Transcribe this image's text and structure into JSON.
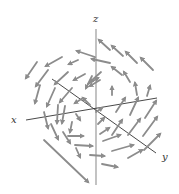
{
  "figure": {
    "type": "3d-vector-field",
    "axes": {
      "x_label": "x",
      "y_label": "y",
      "z_label": "z"
    },
    "colors": {
      "arrow": "#8c8c8c",
      "axis": "#333333",
      "z_axis": "#9a9a9a",
      "background": "#ffffff"
    },
    "arrows": [
      {
        "x1": 153,
        "y1": 70,
        "x2": 141,
        "y2": 58
      },
      {
        "x1": 137,
        "y1": 63,
        "x2": 126,
        "y2": 52
      },
      {
        "x1": 123,
        "y1": 56,
        "x2": 112,
        "y2": 46
      },
      {
        "x1": 110,
        "y1": 50,
        "x2": 99,
        "y2": 40
      },
      {
        "x1": 95,
        "y1": 57,
        "x2": 77,
        "y2": 51
      },
      {
        "x1": 37,
        "y1": 62,
        "x2": 26,
        "y2": 78
      },
      {
        "x1": 62,
        "y1": 57,
        "x2": 46,
        "y2": 66
      },
      {
        "x1": 78,
        "y1": 60,
        "x2": 69,
        "y2": 64
      },
      {
        "x1": 110,
        "y1": 63,
        "x2": 92,
        "y2": 59
      },
      {
        "x1": 122,
        "y1": 75,
        "x2": 112,
        "y2": 67
      },
      {
        "x1": 130,
        "y1": 82,
        "x2": 124,
        "y2": 72
      },
      {
        "x1": 48,
        "y1": 70,
        "x2": 36,
        "y2": 86
      },
      {
        "x1": 68,
        "y1": 72,
        "x2": 55,
        "y2": 84
      },
      {
        "x1": 85,
        "y1": 74,
        "x2": 74,
        "y2": 80
      },
      {
        "x1": 100,
        "y1": 80,
        "x2": 90,
        "y2": 86
      },
      {
        "x1": 92,
        "y1": 76,
        "x2": 86,
        "y2": 88
      },
      {
        "x1": 101,
        "y1": 72,
        "x2": 90,
        "y2": 82
      },
      {
        "x1": 112,
        "y1": 95,
        "x2": 112,
        "y2": 87
      },
      {
        "x1": 137,
        "y1": 95,
        "x2": 135,
        "y2": 83
      },
      {
        "x1": 147,
        "y1": 96,
        "x2": 150,
        "y2": 86
      },
      {
        "x1": 40,
        "y1": 85,
        "x2": 35,
        "y2": 103
      },
      {
        "x1": 55,
        "y1": 88,
        "x2": 47,
        "y2": 106
      },
      {
        "x1": 72,
        "y1": 88,
        "x2": 60,
        "y2": 102
      },
      {
        "x1": 83,
        "y1": 98,
        "x2": 75,
        "y2": 103
      },
      {
        "x1": 90,
        "y1": 105,
        "x2": 83,
        "y2": 98
      },
      {
        "x1": 116,
        "y1": 112,
        "x2": 125,
        "y2": 98
      },
      {
        "x1": 130,
        "y1": 115,
        "x2": 138,
        "y2": 98
      },
      {
        "x1": 145,
        "y1": 118,
        "x2": 156,
        "y2": 101
      },
      {
        "x1": 44,
        "y1": 112,
        "x2": 48,
        "y2": 128
      },
      {
        "x1": 58,
        "y1": 105,
        "x2": 57,
        "y2": 123
      },
      {
        "x1": 65,
        "y1": 106,
        "x2": 62,
        "y2": 123
      },
      {
        "x1": 76,
        "y1": 114,
        "x2": 80,
        "y2": 120
      },
      {
        "x1": 72,
        "y1": 122,
        "x2": 70,
        "y2": 132
      },
      {
        "x1": 98,
        "y1": 124,
        "x2": 104,
        "y2": 118
      },
      {
        "x1": 112,
        "y1": 135,
        "x2": 122,
        "y2": 120
      },
      {
        "x1": 128,
        "y1": 135,
        "x2": 140,
        "y2": 119
      },
      {
        "x1": 143,
        "y1": 136,
        "x2": 157,
        "y2": 117
      },
      {
        "x1": 144,
        "y1": 150,
        "x2": 160,
        "y2": 134
      },
      {
        "x1": 51,
        "y1": 124,
        "x2": 58,
        "y2": 139
      },
      {
        "x1": 63,
        "y1": 132,
        "x2": 70,
        "y2": 143
      },
      {
        "x1": 68,
        "y1": 136,
        "x2": 83,
        "y2": 136
      },
      {
        "x1": 75,
        "y1": 145,
        "x2": 92,
        "y2": 146
      },
      {
        "x1": 100,
        "y1": 134,
        "x2": 109,
        "y2": 128
      },
      {
        "x1": 103,
        "y1": 141,
        "x2": 120,
        "y2": 135
      },
      {
        "x1": 112,
        "y1": 151,
        "x2": 133,
        "y2": 145
      },
      {
        "x1": 128,
        "y1": 158,
        "x2": 142,
        "y2": 150
      },
      {
        "x1": 76,
        "y1": 148,
        "x2": 80,
        "y2": 157
      },
      {
        "x1": 90,
        "y1": 155,
        "x2": 104,
        "y2": 156
      },
      {
        "x1": 102,
        "y1": 164,
        "x2": 117,
        "y2": 167
      },
      {
        "x1": 44,
        "y1": 140,
        "x2": 88,
        "y2": 182
      },
      {
        "x1": 96,
        "y1": 112,
        "x2": 102,
        "y2": 108
      },
      {
        "x1": 88,
        "y1": 84,
        "x2": 98,
        "y2": 78
      }
    ]
  }
}
